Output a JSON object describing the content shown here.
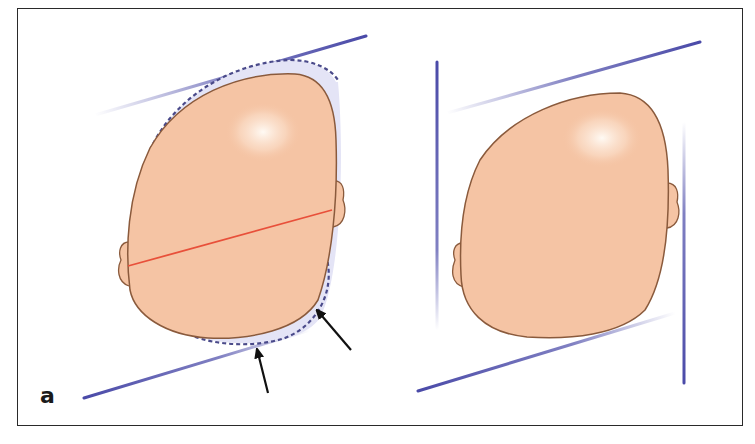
{
  "figure": {
    "panel_label": "a",
    "caption": "",
    "colors": {
      "frame": "#2a2a2a",
      "skin": "#f5c4a4",
      "skin_outline": "#8a5a3c",
      "highlight": "#fff6ee",
      "guide_line": "#4a4aa8",
      "dashed_outline": "#4a4a8a",
      "deformity_fill": "#e4e4f6",
      "measure_line": "#e8503a",
      "arrow": "#111111"
    },
    "left_panel": {
      "description": "Plagiocephalic head (top view) with dashed normal outline, red diagonal measurement line, and two arrows indicating flattening",
      "arrows": 2
    },
    "right_panel": {
      "description": "Head (top view) within parallelogram guide lines"
    }
  }
}
